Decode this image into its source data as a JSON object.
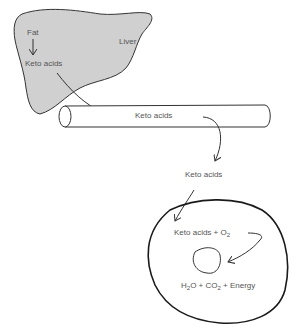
{
  "diagram": {
    "liver": {
      "organ_label": "Liver",
      "input_label": "Fat",
      "output_label": "Keto acids",
      "fill": "#d0d0d0"
    },
    "vessel": {
      "label": "Keto acids"
    },
    "transit": {
      "label": "Keto acids"
    },
    "cell": {
      "reactant_main": "Keto acids + O",
      "reactant_sub": "2",
      "product_part1": "H",
      "product_sub1": "2",
      "product_part2": "O + CO",
      "product_sub2": "2",
      "product_part3": " + Energy"
    },
    "colors": {
      "stroke": "#222222",
      "text": "#555555",
      "liver_fill": "#d0d0d0"
    }
  }
}
